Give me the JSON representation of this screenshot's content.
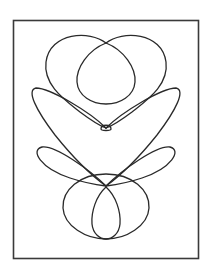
{
  "figure": {
    "stroke_color": "#2a2a2a",
    "background": "#ffffff",
    "frame": {
      "x": 13,
      "y": 20,
      "width": 186,
      "height": 239
    }
  }
}
